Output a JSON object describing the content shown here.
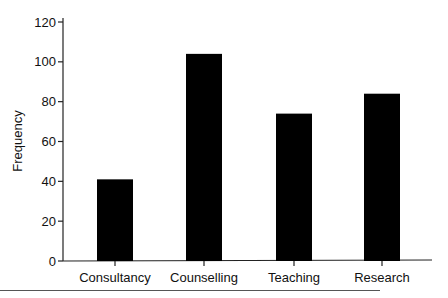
{
  "chart_data": {
    "type": "bar",
    "title": "",
    "xlabel": "",
    "ylabel": "Frequency",
    "categories": [
      "Consultancy",
      "Counselling",
      "Teaching",
      "Research"
    ],
    "values": [
      41,
      104,
      74,
      84
    ],
    "ylim": [
      0,
      120
    ],
    "yticks": [
      0,
      20,
      40,
      60,
      80,
      100,
      120
    ],
    "ytick_labels": [
      "0",
      "20",
      "40",
      "60",
      "80",
      "100",
      "120"
    ],
    "grid": false,
    "legend": null,
    "bar_color": "#000000"
  }
}
